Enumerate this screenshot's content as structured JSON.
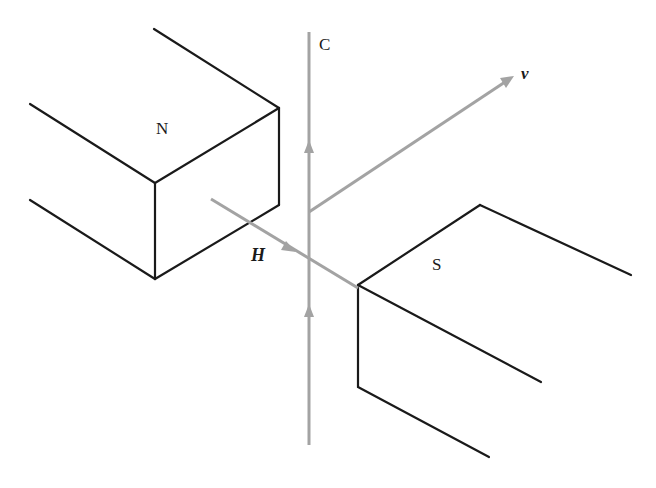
{
  "diagram": {
    "type": "physics-illustration",
    "colors": {
      "magnet_stroke": "#1a1a1a",
      "vector_stroke": "#a3a3a3",
      "background": "#ffffff"
    },
    "labels": {
      "north_pole": "N",
      "south_pole": "S",
      "conductor": "C",
      "field": "H",
      "velocity": "v"
    },
    "elements": {
      "north_magnet": {
        "label": "N",
        "position": "upper-left"
      },
      "south_magnet": {
        "label": "S",
        "position": "lower-right"
      },
      "conductor_wire": {
        "label": "C",
        "orientation": "vertical",
        "current_direction": "up",
        "arrowheads": 2
      },
      "field_vector": {
        "label": "H",
        "direction": "from N toward S"
      },
      "velocity_vector": {
        "label": "v",
        "direction": "up-right"
      }
    }
  }
}
